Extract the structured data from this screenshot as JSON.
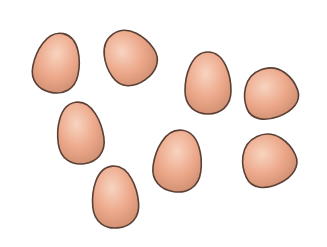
{
  "scene": {
    "subject": "eggs",
    "count": 8,
    "background": "#ffffff",
    "colors": {
      "shell_light": "#f6c9b0",
      "shell_mid": "#e9a283",
      "shell_shadow": "#c98a6e",
      "outline": "#5a4035"
    },
    "eggs": [
      {
        "cx": 57,
        "cy": 63,
        "rx": 23,
        "ry": 30,
        "rot": 12
      },
      {
        "cx": 129,
        "cy": 57,
        "rx": 25,
        "ry": 28,
        "rot": -35
      },
      {
        "cx": 208,
        "cy": 83,
        "rx": 23,
        "ry": 31,
        "rot": 0
      },
      {
        "cx": 270,
        "cy": 93,
        "rx": 27,
        "ry": 25,
        "rot": -20
      },
      {
        "cx": 80,
        "cy": 133,
        "rx": 23,
        "ry": 31,
        "rot": -8
      },
      {
        "cx": 178,
        "cy": 161,
        "rx": 24,
        "ry": 31,
        "rot": 8
      },
      {
        "cx": 268,
        "cy": 160,
        "rx": 27,
        "ry": 26,
        "rot": -25
      },
      {
        "cx": 115,
        "cy": 197,
        "rx": 23,
        "ry": 31,
        "rot": -5
      }
    ]
  }
}
